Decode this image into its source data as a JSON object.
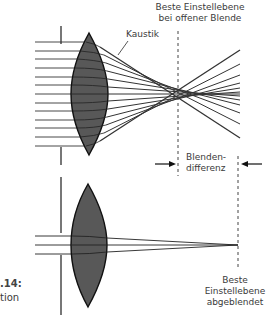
{
  "diagram": {
    "labels": {
      "top_plane_line1": "Beste Einstellebene",
      "top_plane_line2": "bei offener Blende",
      "caustic": "Kaustik",
      "diff_line1": "Blenden-",
      "diff_line2": "differenz",
      "bottom_plane_line1": "Beste",
      "bottom_plane_line2": "Einstellebene",
      "bottom_plane_line3": "abgeblendet",
      "figure_number": ".14:",
      "figure_caption_fragment": "tion"
    },
    "colors": {
      "lens_fill": "#555555",
      "lens_stroke": "#111111",
      "ray": "#222222",
      "dashed_plane": "#444444"
    },
    "top_system": {
      "aperture": "open",
      "ray_count": 13
    },
    "bottom_system": {
      "aperture": "stopped down",
      "ray_count": 3
    }
  }
}
